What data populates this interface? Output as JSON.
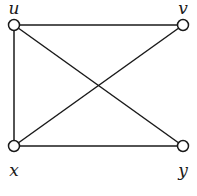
{
  "graph": {
    "nodes": [
      {
        "id": "u",
        "label": "u",
        "x": 14,
        "y": 25,
        "lx": 14,
        "ly": 14
      },
      {
        "id": "v",
        "label": "v",
        "x": 183,
        "y": 25,
        "lx": 183,
        "ly": 14
      },
      {
        "id": "x",
        "label": "x",
        "x": 14,
        "y": 146,
        "lx": 14,
        "ly": 176
      },
      {
        "id": "y",
        "label": "y",
        "x": 183,
        "y": 146,
        "lx": 183,
        "ly": 176
      }
    ],
    "edges": [
      {
        "from": "u",
        "to": "v"
      },
      {
        "from": "u",
        "to": "x"
      },
      {
        "from": "u",
        "to": "y"
      },
      {
        "from": "v",
        "to": "x"
      },
      {
        "from": "x",
        "to": "y"
      }
    ],
    "colors": {
      "stroke": "#1a1a1a",
      "node_fill": "#ffffff",
      "background": "#ffffff"
    }
  }
}
